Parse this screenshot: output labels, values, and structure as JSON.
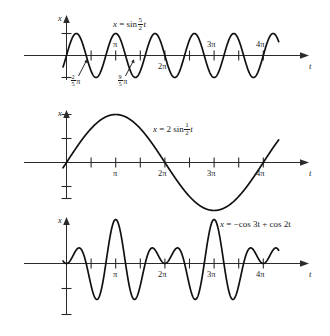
{
  "figure": {
    "background": "#ffffff",
    "ink": "#111111",
    "width": 330,
    "height": 336,
    "partial_top_line": ""
  },
  "chart_data": [
    {
      "type": "line",
      "id": "panel-1",
      "title": "",
      "equation_text": "x = sin 5/2 t",
      "equation_parts": {
        "lhs": "x",
        "equals": "=",
        "fn": "sin",
        "num": "5",
        "den": "2",
        "var": "t"
      },
      "function": "sin(2.5*t)",
      "xlabel": "t",
      "ylabel": "x",
      "xlim": [
        -0.45,
        13.9
      ],
      "ylim": [
        -1.55,
        1.55
      ],
      "amplitude": 1,
      "angular_frequency": 2.5,
      "grid": false,
      "x_tick_values": [
        1.5708,
        3.1416,
        4.7124,
        6.2832,
        7.854,
        9.4248,
        10.9956,
        12.5664
      ],
      "x_tick_labels": [
        {
          "value": 3.1416,
          "text": "π"
        },
        {
          "value": 6.2832,
          "text": "2π"
        },
        {
          "value": 9.4248,
          "text": "3π"
        },
        {
          "value": 12.5664,
          "text": "4π"
        }
      ],
      "y_tick_values": [
        1,
        -1
      ],
      "annotations": [
        {
          "text_num": "2",
          "text_den": "5",
          "text_suffix": "π",
          "at_t": 1.2566,
          "kind": "zero-crossing-pointer"
        },
        {
          "text_num": "9",
          "text_den": "5",
          "text_suffix": "π",
          "at_t": 5.655,
          "kind": "zero-crossing-pointer"
        }
      ]
    },
    {
      "type": "line",
      "id": "panel-2",
      "title": "",
      "equation_text": "x = 2 sin 1/2 t",
      "equation_parts": {
        "lhs": "x",
        "equals": "=",
        "coef": "2",
        "fn": "sin",
        "num": "1",
        "den": "2",
        "var": "t"
      },
      "function": "2*sin(0.5*t)",
      "xlabel": "t",
      "ylabel": "x",
      "xlim": [
        -0.45,
        13.9
      ],
      "ylim": [
        -2.6,
        2.6
      ],
      "amplitude": 2,
      "angular_frequency": 0.5,
      "grid": false,
      "x_tick_values": [
        1.5708,
        3.1416,
        4.7124,
        6.2832,
        7.854,
        9.4248,
        10.9956,
        12.5664
      ],
      "x_tick_labels": [
        {
          "value": 3.1416,
          "text": "π"
        },
        {
          "value": 6.2832,
          "text": "2π"
        },
        {
          "value": 9.4248,
          "text": "3π"
        },
        {
          "value": 12.5664,
          "text": "4π"
        }
      ],
      "y_tick_values": [
        1,
        2,
        -1,
        -2
      ],
      "annotations": []
    },
    {
      "type": "line",
      "id": "panel-3",
      "title": "",
      "equation_text": "x = −cos 3t + cos 2t",
      "equation_parts": {
        "lhs": "x",
        "equals": "=",
        "term1": "−cos 3t",
        "plus": "+",
        "term2": "cos 2t"
      },
      "function": "-cos(3*t) + cos(2*t)",
      "xlabel": "t",
      "ylabel": "x",
      "xlim": [
        -0.45,
        13.9
      ],
      "ylim": [
        -2.3,
        2.3
      ],
      "grid": false,
      "x_tick_values": [
        1.5708,
        3.1416,
        4.7124,
        6.2832,
        7.854,
        9.4248,
        10.9956,
        12.5664
      ],
      "x_tick_labels": [
        {
          "value": 3.1416,
          "text": "π"
        },
        {
          "value": 6.2832,
          "text": "2π"
        },
        {
          "value": 9.4248,
          "text": "3π"
        },
        {
          "value": 12.5664,
          "text": "4π"
        }
      ],
      "y_tick_values": [
        -1,
        -2
      ],
      "annotations": []
    }
  ],
  "labels": {
    "x_axis_name": "t",
    "y_axis_name": "x",
    "pi": "π",
    "two_pi": "2π",
    "three_pi": "3π",
    "four_pi": "4π"
  }
}
